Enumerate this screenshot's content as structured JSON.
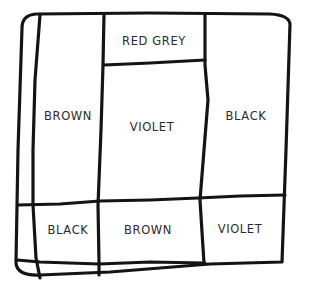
{
  "diagram": {
    "type": "color-region-map",
    "stroke_color": "#141414",
    "background": "#ffffff",
    "regions": [
      {
        "id": "top-middle",
        "label": "RED GREY",
        "x": 154,
        "y": 41
      },
      {
        "id": "left-tall",
        "label": "BROWN",
        "x": 68,
        "y": 116
      },
      {
        "id": "middle-tall",
        "label": "VIOLET",
        "x": 152,
        "y": 127
      },
      {
        "id": "right-tall",
        "label": "BLACK",
        "x": 246,
        "y": 116
      },
      {
        "id": "bottom-left",
        "label": "BLACK",
        "x": 68,
        "y": 230
      },
      {
        "id": "bottom-middle",
        "label": "BROWN",
        "x": 148,
        "y": 230
      },
      {
        "id": "bottom-right",
        "label": "VIOLET",
        "x": 240,
        "y": 229
      }
    ]
  }
}
